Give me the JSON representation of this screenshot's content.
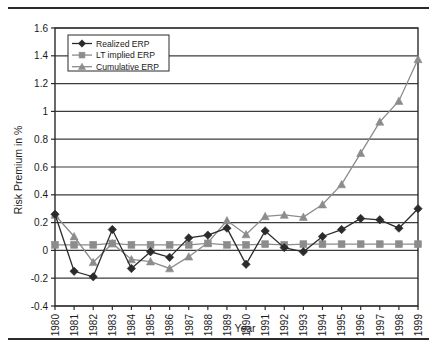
{
  "chart_data": {
    "type": "line",
    "title": "",
    "xlabel": "Year",
    "ylabel": "Risk Premium in %",
    "x": [
      1980,
      1981,
      1982,
      1983,
      1984,
      1985,
      1986,
      1987,
      1988,
      1989,
      1990,
      1991,
      1992,
      1993,
      1994,
      1995,
      1996,
      1997,
      1998,
      1999
    ],
    "categories": [
      "1980",
      "1981",
      "1982",
      "1983",
      "1984",
      "1985",
      "1986",
      "1987",
      "1988",
      "1989",
      "1990",
      "1991",
      "1992",
      "1993",
      "1994",
      "1995",
      "1996",
      "1997",
      "1998",
      "1999"
    ],
    "series": [
      {
        "name": "Realized ERP",
        "color": "#2b2b2b",
        "marker": "diamond",
        "values": [
          0.26,
          -0.15,
          -0.19,
          0.15,
          -0.13,
          -0.01,
          -0.05,
          0.09,
          0.11,
          0.16,
          -0.1,
          0.14,
          0.02,
          -0.01,
          0.1,
          0.15,
          0.23,
          0.22,
          0.16,
          0.3
        ]
      },
      {
        "name": "LT implied ERP",
        "color": "#8c8c8c",
        "marker": "square",
        "values": [
          0.04,
          0.04,
          0.04,
          0.05,
          0.04,
          0.04,
          0.04,
          0.04,
          0.05,
          0.04,
          0.04,
          0.045,
          0.04,
          0.045,
          0.045,
          0.045,
          0.045,
          0.045,
          0.045,
          0.045
        ]
      },
      {
        "name": "Cumulative ERP",
        "color": "#8c8c8c",
        "marker": "triangle",
        "values": [
          0.255,
          0.1,
          -0.085,
          0.05,
          -0.065,
          -0.08,
          -0.13,
          -0.045,
          0.055,
          0.215,
          0.115,
          0.245,
          0.255,
          0.24,
          0.33,
          0.475,
          0.7,
          0.925,
          1.075,
          1.375
        ]
      }
    ],
    "ylim": [
      -0.4,
      1.6
    ],
    "ytick_labels": [
      "1.6",
      "1.4",
      "1.2",
      "1",
      "0.8",
      "0.6",
      "0.4",
      "0.2",
      "0",
      "-0.2",
      "-0.4"
    ],
    "ytick_values": [
      1.6,
      1.4,
      1.2,
      1.0,
      0.8,
      0.6,
      0.4,
      0.2,
      0,
      -0.2,
      -0.4
    ],
    "grid": true,
    "grid_axis": "y",
    "legend_position": "top-left",
    "legend": [
      "Realized ERP",
      "LT implied ERP",
      "Cumulative ERP"
    ]
  },
  "colors": {
    "realized": "#2b2b2b",
    "lt_implied": "#8c8c8c",
    "cumulative": "#8c8c8c",
    "axis": "#2b2b2b",
    "grid": "#3c3c3c",
    "background": "#ffffff"
  }
}
